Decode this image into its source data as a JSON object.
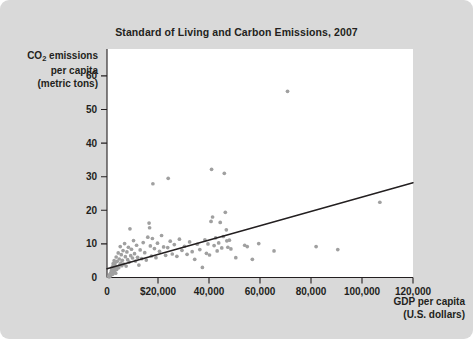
{
  "figure": {
    "background_color": "#d9d9d9",
    "plot_background_color": "#ffffff",
    "point_color": "#a0a0a0",
    "line_color": "#231f20"
  },
  "title": "Standard of Living and Carbon Emissions, 2007",
  "y_axis": {
    "line1": "CO",
    "sub": "2",
    "line1_rest": " emissions",
    "line2": "per capita",
    "line3": "(metric tons)"
  },
  "x_axis": {
    "line1": "GDP per capita",
    "line2": "(U.S. dollars)"
  },
  "chart_data": {
    "type": "scatter",
    "title": "Standard of Living and Carbon Emissions, 2007",
    "xlabel": "GDP per capita (U.S. dollars)",
    "ylabel": "CO2 emissions per capita (metric tons)",
    "xlim": [
      0,
      120000
    ],
    "ylim": [
      0,
      68
    ],
    "grid": false,
    "legend": "none",
    "x_tick_values": [
      0,
      20000,
      40000,
      60000,
      80000,
      100000,
      120000
    ],
    "x_tick_labels": [
      "0",
      "$20,000",
      "40,000",
      "60,000",
      "80,000",
      "100,000",
      "120,000"
    ],
    "y_tick_values": [
      0,
      10,
      20,
      30,
      40,
      50,
      60
    ],
    "y_tick_labels": [
      "0",
      "10",
      "20",
      "30",
      "40",
      "50",
      "60"
    ],
    "trend_line": {
      "x": [
        0,
        120000
      ],
      "y": [
        2.6,
        28.2
      ],
      "style": "solid",
      "color": "#231f20"
    },
    "points": [
      [
        700,
        0.3
      ],
      [
        900,
        0.2
      ],
      [
        1000,
        0.5
      ],
      [
        1100,
        0.9
      ],
      [
        1200,
        0.4
      ],
      [
        1300,
        1.1
      ],
      [
        1400,
        0.6
      ],
      [
        1500,
        1.4
      ],
      [
        1600,
        0.8
      ],
      [
        1700,
        2.0
      ],
      [
        1800,
        1.2
      ],
      [
        1900,
        2.6
      ],
      [
        2000,
        1.7
      ],
      [
        2100,
        3.2
      ],
      [
        2200,
        1.0
      ],
      [
        2300,
        2.3
      ],
      [
        2400,
        4.1
      ],
      [
        2500,
        1.5
      ],
      [
        2600,
        3.0
      ],
      [
        2700,
        2.2
      ],
      [
        2800,
        5.0
      ],
      [
        2900,
        1.9
      ],
      [
        3000,
        3.6
      ],
      [
        3100,
        2.7
      ],
      [
        3200,
        4.4
      ],
      [
        3400,
        1.3
      ],
      [
        3500,
        3.3
      ],
      [
        3600,
        6.1
      ],
      [
        3800,
        2.4
      ],
      [
        4000,
        4.8
      ],
      [
        4200,
        3.1
      ],
      [
        4400,
        7.3
      ],
      [
        4600,
        2.9
      ],
      [
        4800,
        5.5
      ],
      [
        5000,
        3.8
      ],
      [
        5200,
        9.2
      ],
      [
        5400,
        4.3
      ],
      [
        5600,
        6.8
      ],
      [
        5800,
        3.5
      ],
      [
        6000,
        5.1
      ],
      [
        6300,
        8.0
      ],
      [
        6600,
        4.0
      ],
      [
        6900,
        10.1
      ],
      [
        7200,
        6.2
      ],
      [
        7500,
        3.4
      ],
      [
        7800,
        7.6
      ],
      [
        8100,
        5.3
      ],
      [
        8400,
        9.0
      ],
      [
        8700,
        4.6
      ],
      [
        9000,
        14.5
      ],
      [
        9300,
        6.5
      ],
      [
        9600,
        8.4
      ],
      [
        10000,
        5.8
      ],
      [
        10400,
        11.0
      ],
      [
        10800,
        7.1
      ],
      [
        11200,
        4.9
      ],
      [
        11600,
        9.6
      ],
      [
        12000,
        6.0
      ],
      [
        12500,
        3.7
      ],
      [
        13000,
        8.2
      ],
      [
        13600,
        5.6
      ],
      [
        14200,
        10.4
      ],
      [
        14800,
        7.4
      ],
      [
        15400,
        5.2
      ],
      [
        16000,
        12.0
      ],
      [
        16500,
        16.2
      ],
      [
        16700,
        14.8
      ],
      [
        17000,
        9.4
      ],
      [
        17400,
        6.4
      ],
      [
        17800,
        11.6
      ],
      [
        18000,
        27.9
      ],
      [
        18600,
        8.6
      ],
      [
        19200,
        5.9
      ],
      [
        19800,
        10.2
      ],
      [
        20600,
        7.8
      ],
      [
        21400,
        12.5
      ],
      [
        22200,
        9.1
      ],
      [
        23000,
        6.6
      ],
      [
        23800,
        8.9
      ],
      [
        24000,
        29.5
      ],
      [
        24800,
        10.8
      ],
      [
        25600,
        7.0
      ],
      [
        26400,
        9.8
      ],
      [
        27400,
        6.3
      ],
      [
        28400,
        11.4
      ],
      [
        29400,
        8.1
      ],
      [
        30400,
        9.3
      ],
      [
        31400,
        6.9
      ],
      [
        32400,
        10.6
      ],
      [
        33400,
        7.7
      ],
      [
        34400,
        5.4
      ],
      [
        35400,
        9.9
      ],
      [
        36400,
        8.3
      ],
      [
        37400,
        3.0
      ],
      [
        38400,
        11.2
      ],
      [
        39000,
        7.2
      ],
      [
        39600,
        10.0
      ],
      [
        40200,
        6.7
      ],
      [
        40800,
        16.7
      ],
      [
        41000,
        32.2
      ],
      [
        41400,
        18.0
      ],
      [
        42000,
        9.5
      ],
      [
        42600,
        11.8
      ],
      [
        43200,
        7.9
      ],
      [
        43800,
        10.3
      ],
      [
        44400,
        16.4
      ],
      [
        45000,
        8.8
      ],
      [
        45600,
        12.2
      ],
      [
        46000,
        31.0
      ],
      [
        46400,
        19.4
      ],
      [
        46800,
        14.2
      ],
      [
        47000,
        10.9
      ],
      [
        47400,
        9.0
      ],
      [
        48000,
        11.1
      ],
      [
        48600,
        8.5
      ],
      [
        50500,
        5.9
      ],
      [
        54000,
        9.6
      ],
      [
        55000,
        9.2
      ],
      [
        57000,
        5.4
      ],
      [
        59500,
        10.1
      ],
      [
        65500,
        7.9
      ],
      [
        70800,
        55.4
      ],
      [
        82000,
        9.2
      ],
      [
        90500,
        8.3
      ],
      [
        107000,
        22.4
      ]
    ]
  }
}
